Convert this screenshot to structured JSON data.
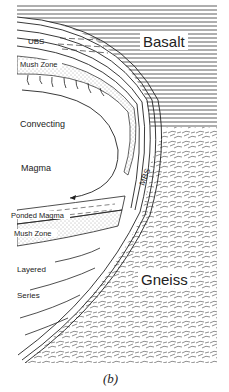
{
  "figure": {
    "caption": "(b)",
    "colors": {
      "ink": "#222222",
      "background": "#ffffff",
      "stipple": "#555555"
    }
  },
  "labels": {
    "ubs": "UBS",
    "basalt": "Basalt",
    "mush_zone_top": "Mush Zone",
    "convecting": "Convecting",
    "magma": "Magma",
    "mbs": "MBS",
    "ponded_magma": "Ponded Magma",
    "mush_zone_bottom": "Mush Zone",
    "layered": "Layered",
    "series": "Series",
    "gneiss": "Gneiss"
  }
}
